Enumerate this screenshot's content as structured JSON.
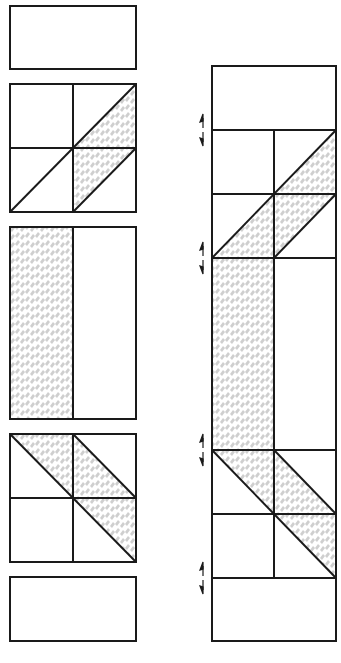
{
  "diagram": {
    "colors": {
      "line": "#1a1a1a",
      "fabric": "#cfcfcf",
      "background": "#ffffff"
    },
    "left_column": {
      "label": "Units laid out in rows",
      "units": [
        {
          "name": "rectangle-top",
          "type": "plain rectangle"
        },
        {
          "name": "four-patch-upper",
          "type": "2x2 grid with diagonal shaded band (bottom-left to top-right)"
        },
        {
          "name": "strip-unit",
          "type": "rectangle with shaded left half"
        },
        {
          "name": "four-patch-lower",
          "type": "2x2 grid with diagonal shaded band (top-left to bottom-right)"
        },
        {
          "name": "rectangle-bottom",
          "type": "plain rectangle"
        }
      ]
    },
    "right_column": {
      "label": "Assembled column",
      "pressing_arrows": [
        {
          "name": "seam-1",
          "direction": "up/down"
        },
        {
          "name": "seam-2",
          "direction": "up/down"
        },
        {
          "name": "seam-3",
          "direction": "up/down"
        },
        {
          "name": "seam-4",
          "direction": "up/down"
        }
      ]
    }
  }
}
